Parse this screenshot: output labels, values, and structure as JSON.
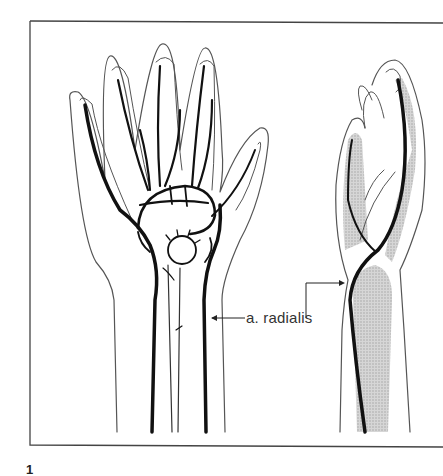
{
  "figure": {
    "type": "anatomical-illustration",
    "views": [
      "dorsal/palmar view of hand",
      "lateral view of hand"
    ],
    "number": "1"
  },
  "labels": {
    "artery": "a. radialis"
  },
  "colors": {
    "line": "#111111",
    "outline": "#444444",
    "bone_shading": "#c8c8c8",
    "background": "#ffffff"
  }
}
